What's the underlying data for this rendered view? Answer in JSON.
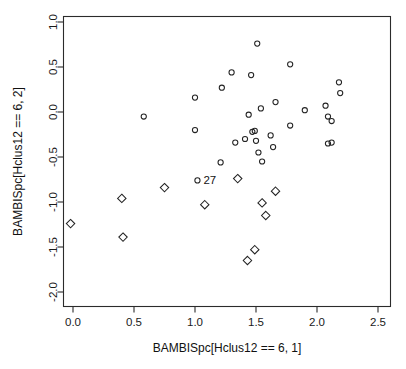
{
  "chart_data": {
    "type": "scatter",
    "title": "",
    "xlabel": "BAMBISpc[Hclus12 == 6, 1]",
    "ylabel": "BAMBISpc[Hclus12 == 6, 2]",
    "xlim": [
      -0.18,
      2.62
    ],
    "ylim": [
      -2.15,
      1.12
    ],
    "xticks": [
      0.0,
      0.5,
      1.0,
      1.5,
      2.0,
      2.5
    ],
    "xtick_labels": [
      "0.0",
      "0.5",
      "1.0",
      "1.5",
      "2.0",
      "2.5"
    ],
    "yticks": [
      1.0,
      0.5,
      0.0,
      -0.5,
      -1.0,
      -1.5,
      -2.0
    ],
    "ytick_labels": [
      "1.0",
      "0.5",
      "0.0",
      "-0.5",
      "-1.0",
      "-1.5",
      "-2.0"
    ],
    "grid": false,
    "legend": "none",
    "box": true,
    "series": [
      {
        "name": "circles",
        "marker": "circle",
        "points": [
          {
            "x": 0.58,
            "y": -0.05
          },
          {
            "x": 1.0,
            "y": 0.16
          },
          {
            "x": 1.0,
            "y": -0.2
          },
          {
            "x": 1.22,
            "y": 0.27
          },
          {
            "x": 1.3,
            "y": 0.44
          },
          {
            "x": 1.21,
            "y": -0.56
          },
          {
            "x": 1.33,
            "y": -0.34
          },
          {
            "x": 1.02,
            "y": -0.76,
            "label": "27"
          },
          {
            "x": 1.41,
            "y": -0.3
          },
          {
            "x": 1.44,
            "y": -0.03
          },
          {
            "x": 1.46,
            "y": 0.41
          },
          {
            "x": 1.47,
            "y": -0.22
          },
          {
            "x": 1.49,
            "y": -0.21
          },
          {
            "x": 1.5,
            "y": -0.32
          },
          {
            "x": 1.51,
            "y": 0.76
          },
          {
            "x": 1.54,
            "y": 0.04
          },
          {
            "x": 1.52,
            "y": -0.45
          },
          {
            "x": 1.55,
            "y": -0.55
          },
          {
            "x": 1.62,
            "y": -0.26
          },
          {
            "x": 1.64,
            "y": -0.39
          },
          {
            "x": 1.66,
            "y": 0.11
          },
          {
            "x": 1.78,
            "y": 0.53
          },
          {
            "x": 1.78,
            "y": -0.15
          },
          {
            "x": 1.9,
            "y": 0.02
          },
          {
            "x": 2.07,
            "y": 0.07
          },
          {
            "x": 2.09,
            "y": -0.05
          },
          {
            "x": 2.12,
            "y": -0.1
          },
          {
            "x": 2.09,
            "y": -0.35
          },
          {
            "x": 2.12,
            "y": -0.34
          },
          {
            "x": 2.18,
            "y": 0.33
          },
          {
            "x": 2.19,
            "y": 0.21
          }
        ]
      },
      {
        "name": "diamonds",
        "marker": "diamond",
        "points": [
          {
            "x": -0.02,
            "y": -1.24
          },
          {
            "x": 0.4,
            "y": -0.96
          },
          {
            "x": 0.41,
            "y": -1.39
          },
          {
            "x": 0.75,
            "y": -0.84
          },
          {
            "x": 1.08,
            "y": -1.03
          },
          {
            "x": 1.35,
            "y": -0.74
          },
          {
            "x": 1.43,
            "y": -1.65
          },
          {
            "x": 1.49,
            "y": -1.53
          },
          {
            "x": 1.55,
            "y": -1.01
          },
          {
            "x": 1.58,
            "y": -1.15
          },
          {
            "x": 1.66,
            "y": -0.88
          }
        ]
      }
    ]
  }
}
